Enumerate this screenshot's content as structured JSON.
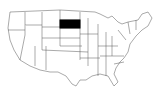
{
  "map": {
    "region": "United States",
    "highlighted_state": "South Dakota",
    "highlight_color": "#000000",
    "base_fill": "#ffffff",
    "border_color": "#555555"
  }
}
